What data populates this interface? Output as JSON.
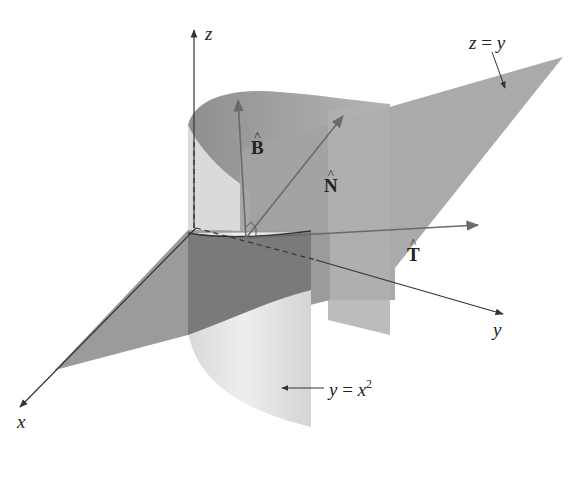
{
  "figure": {
    "colors": {
      "background": "#ffffff",
      "plane_fill": "#9a9a9a",
      "plane_fill_dark": "#7d7d7d",
      "cylinder_front": "#e6e6e6",
      "cylinder_back": "#c2c2c2",
      "cylinder_inner_top": "#a8a8a8",
      "intersection_front": "#707070",
      "axis_line": "#333333",
      "vector_line": "#6a6a6a"
    },
    "axes": {
      "x": {
        "label": "x"
      },
      "y": {
        "label": "y"
      },
      "z": {
        "label": "z"
      }
    },
    "vectors": {
      "T": {
        "label": "T",
        "hat": "^"
      },
      "N": {
        "label": "N",
        "hat": "^"
      },
      "B": {
        "label": "B",
        "hat": "^"
      }
    },
    "surfaces": {
      "plane": {
        "label_lhs": "z",
        "label_eq": " = ",
        "label_rhs": "y"
      },
      "cylinder": {
        "label_lhs": "y",
        "label_eq": " = ",
        "label_rhs": "x",
        "label_exp": "2"
      }
    }
  }
}
